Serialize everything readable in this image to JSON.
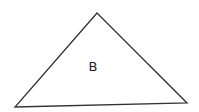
{
  "diagram": {
    "shape": "triangle",
    "label": "B",
    "stroke_color": "#333333",
    "fill_color": "#ffffff",
    "vertices": {
      "top": [
        97,
        13
      ],
      "bottom_left": [
        15,
        107
      ],
      "bottom_right": [
        187,
        103
      ]
    }
  }
}
